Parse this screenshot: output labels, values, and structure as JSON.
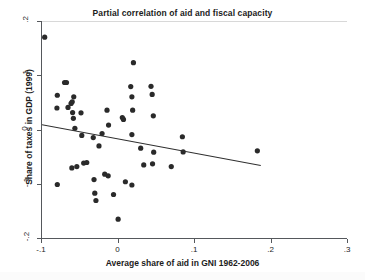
{
  "chart_data": {
    "type": "scatter",
    "title": "Partial correlation of aid and fiscal capacity",
    "xlabel": "Average share of aid in GNI 1962-2006",
    "ylabel": "Share of taxes in GDP (1999)",
    "xlim": [
      -0.1,
      0.3
    ],
    "ylim": [
      -0.2,
      0.2
    ],
    "xticks": [
      -0.1,
      0,
      0.1,
      0.2,
      0.3
    ],
    "xtick_labels": [
      "-.1",
      "0",
      ".1",
      ".2",
      ".3"
    ],
    "yticks": [
      -0.2,
      -0.1,
      0,
      0.1,
      0.2
    ],
    "ytick_labels": [
      "-.2",
      "-.1",
      "0",
      ".1",
      ".2"
    ],
    "grid": false,
    "legend": null,
    "marker_color": "#2a2a2a",
    "line_color": "#2f2f2f",
    "points": [
      [
        -0.0965,
        0.172
      ],
      [
        -0.08,
        0.065
      ],
      [
        -0.0805,
        0.0415
      ],
      [
        -0.0705,
        0.0885
      ],
      [
        -0.068,
        0.0885
      ],
      [
        -0.066,
        0.0425
      ],
      [
        -0.062,
        0.05
      ],
      [
        -0.0605,
        0.053
      ],
      [
        -0.0585,
        0.062
      ],
      [
        -0.059,
        0.0225
      ],
      [
        -0.057,
        0.004
      ],
      [
        -0.06,
        0.033
      ],
      [
        -0.049,
        0.0325
      ],
      [
        -0.048,
        -0.009
      ],
      [
        -0.033,
        -0.013
      ],
      [
        -0.0255,
        -0.0285
      ],
      [
        -0.0215,
        -0.0055
      ],
      [
        -0.013,
        0.01
      ],
      [
        -0.015,
        0.0375
      ],
      [
        0.0065,
        0.0205
      ],
      [
        0.005,
        0.024
      ],
      [
        0.0185,
        0.0375
      ],
      [
        0.0175,
        0.062
      ],
      [
        0.016,
        0.081
      ],
      [
        0.0195,
        0.125
      ],
      [
        0.0175,
        -0.0075
      ],
      [
        0.029,
        -0.0325
      ],
      [
        0.0425,
        0.0815
      ],
      [
        0.044,
        0.0665
      ],
      [
        0.0455,
        0.027
      ],
      [
        0.046,
        -0.04
      ],
      [
        0.0835,
        -0.0115
      ],
      [
        0.0845,
        -0.0395
      ],
      [
        -0.08,
        -0.0995
      ],
      [
        -0.061,
        -0.069
      ],
      [
        -0.0545,
        -0.0665
      ],
      [
        -0.0455,
        -0.06
      ],
      [
        -0.0415,
        -0.059
      ],
      [
        -0.032,
        -0.0905
      ],
      [
        -0.031,
        -0.1155
      ],
      [
        -0.0295,
        -0.129
      ],
      [
        -0.018,
        -0.0805
      ],
      [
        -0.0135,
        -0.0835
      ],
      [
        -0.0065,
        -0.118
      ],
      [
        -0.0005,
        -0.1635
      ],
      [
        0.009,
        -0.0945
      ],
      [
        0.0175,
        -0.1005
      ],
      [
        0.033,
        -0.0635
      ],
      [
        0.0445,
        -0.0615
      ],
      [
        0.069,
        -0.0665
      ],
      [
        0.1815,
        -0.0375
      ]
    ],
    "fit_line": {
      "x": [
        -0.1,
        0.186
      ],
      "y": [
        0.0105,
        -0.0645
      ],
      "style": "solid"
    }
  }
}
